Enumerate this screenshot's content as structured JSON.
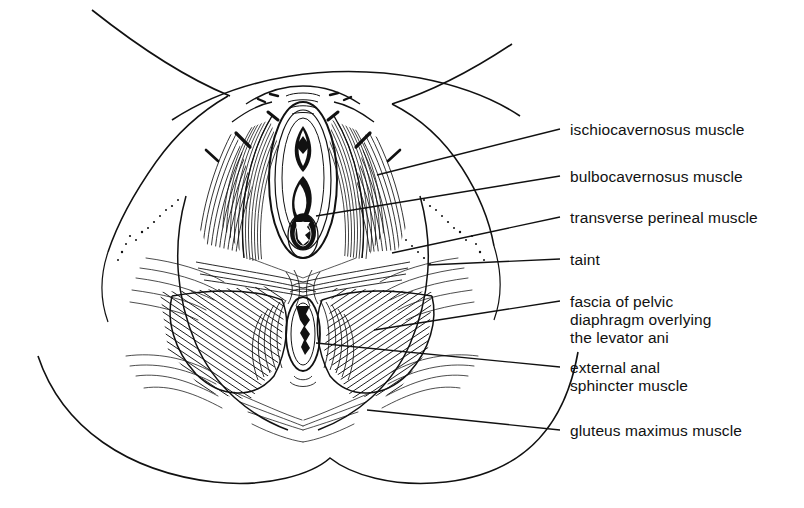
{
  "figure": {
    "background_color": "#ffffff",
    "ink_color": "#111111"
  },
  "labels": [
    {
      "id": "ischiocavernosus",
      "text": "ischiocavernosus muscle",
      "x": 570,
      "y": 121,
      "leader": {
        "x1": 560,
        "y1": 129,
        "x2": 377,
        "y2": 175
      }
    },
    {
      "id": "bulbocavernosus",
      "text": "bulbocavernosus muscle",
      "x": 570,
      "y": 168,
      "leader": {
        "x1": 560,
        "y1": 176,
        "x2": 316,
        "y2": 216
      }
    },
    {
      "id": "transverse-perineal",
      "text": "transverse perineal muscle",
      "x": 570,
      "y": 209,
      "leader": {
        "x1": 560,
        "y1": 217,
        "x2": 392,
        "y2": 253
      }
    },
    {
      "id": "taint",
      "text": "taint",
      "x": 570,
      "y": 251,
      "leader": {
        "x1": 560,
        "y1": 259,
        "x2": 428,
        "y2": 265
      }
    },
    {
      "id": "fascia-pelvic-diaphragm",
      "text": "fascia of pelvic",
      "x": 570,
      "y": 293,
      "leader": {
        "x1": 560,
        "y1": 301,
        "x2": 374,
        "y2": 330
      }
    },
    {
      "id": "fascia-line2",
      "text": "diaphragm overlying",
      "x": 570,
      "y": 311,
      "leader": null
    },
    {
      "id": "fascia-line3",
      "text": "the levator ani",
      "x": 570,
      "y": 329,
      "leader": null
    },
    {
      "id": "external-anal-sphincter",
      "text": "external anal",
      "x": 570,
      "y": 359,
      "leader": {
        "x1": 560,
        "y1": 367,
        "x2": 316,
        "y2": 343
      }
    },
    {
      "id": "sphincter-line2",
      "text": "sphincter muscle",
      "x": 570,
      "y": 377,
      "leader": null
    },
    {
      "id": "gluteus-maximus",
      "text": "gluteus maximus muscle",
      "x": 570,
      "y": 422,
      "leader": {
        "x1": 560,
        "y1": 430,
        "x2": 367,
        "y2": 410
      }
    }
  ]
}
